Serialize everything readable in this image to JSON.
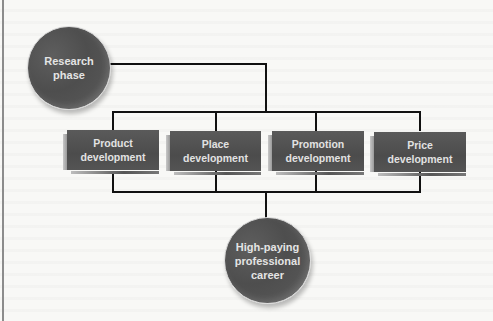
{
  "diagram": {
    "type": "flowchart",
    "start_node": {
      "id": "research",
      "label": "Research\nphase"
    },
    "middle_nodes": [
      {
        "id": "product",
        "label": "Product\ndevelopment"
      },
      {
        "id": "place",
        "label": "Place\ndevelopment"
      },
      {
        "id": "promotion",
        "label": "Promotion\ndevelopment"
      },
      {
        "id": "price",
        "label": "Price\ndevelopment"
      }
    ],
    "end_node": {
      "id": "career",
      "label": "High-paying\nprofessional\ncareer"
    },
    "edges": [
      [
        "research",
        "product"
      ],
      [
        "research",
        "place"
      ],
      [
        "research",
        "promotion"
      ],
      [
        "research",
        "price"
      ],
      [
        "product",
        "career"
      ],
      [
        "place",
        "career"
      ],
      [
        "promotion",
        "career"
      ],
      [
        "price",
        "career"
      ]
    ],
    "colors": {
      "node_fill": "#555555",
      "node_text": "#e2e2e2",
      "connector": "#111111",
      "background": "#f8f8f6"
    }
  }
}
